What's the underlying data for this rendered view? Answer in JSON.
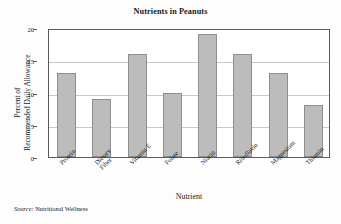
{
  "chart_data": {
    "type": "bar",
    "title": "Nutrients in Peanuts",
    "xlabel": "Nutrient",
    "ylabel_line1": "Percent of",
    "ylabel_line2": "Recommended Daily Allowance",
    "categories": [
      "Protein",
      "Dietary Fiber",
      "Vitamin E",
      "Folate",
      "Niacin",
      "Riboflavin",
      "Magnesium",
      "Thiamin"
    ],
    "category_lines": [
      [
        "Protein"
      ],
      [
        "Dietary",
        "Fiber"
      ],
      [
        "Vitamin E"
      ],
      [
        "Folate"
      ],
      [
        "Niacin"
      ],
      [
        "Riboflavin"
      ],
      [
        "Magnesium"
      ],
      [
        "Thiamin"
      ]
    ],
    "values": [
      13,
      9,
      16,
      10,
      19,
      16,
      13,
      8
    ],
    "ylim": [
      0,
      20
    ],
    "yticks": [
      0,
      5,
      10,
      15,
      20
    ],
    "ytick_labels": [
      "0",
      "5",
      "10",
      "15",
      "20"
    ],
    "grid": true,
    "grid_axis": "y",
    "legend": "none",
    "bar_color": "#bcbcbc",
    "bar_border_color": "#8f8f8f",
    "grid_color": "#c9c9c9",
    "frame_color": "#5a5a5a"
  },
  "source": {
    "label": "Source:",
    "text": " Nutritional Wellness"
  }
}
